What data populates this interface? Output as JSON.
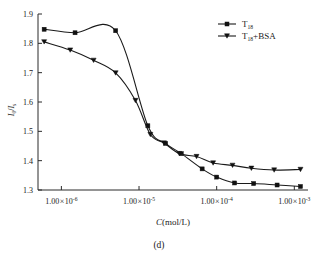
{
  "figure": {
    "caption": "(d)"
  },
  "chart_data": {
    "type": "line",
    "title": "",
    "subtitle": "",
    "xlabel": "C(mol/L)",
    "ylabel": "I0/Is",
    "ylabel_parts": {
      "numerator": "I",
      "numerator_sub": "0",
      "denominator": "I",
      "denominator_sub": "s"
    },
    "xscale": "log",
    "yscale": "linear",
    "xlim": [
      5e-07,
      0.0015
    ],
    "ylim": [
      1.3,
      1.9
    ],
    "grid": false,
    "legend_position": "top-right",
    "yticks": [
      1.3,
      1.4,
      1.5,
      1.6,
      1.7,
      1.8,
      1.9
    ],
    "ytick_labels": [
      "1.3",
      "1.4",
      "1.5",
      "1.6",
      "1.7",
      "1.8",
      "1.9"
    ],
    "xticks": [
      1e-06,
      1e-05,
      0.0001,
      0.001
    ],
    "xtick_labels": [
      {
        "mantissa": "1.00",
        "times": "×",
        "base": "10",
        "exponent": "-6"
      },
      {
        "mantissa": "1.00",
        "times": "×",
        "base": "10",
        "exponent": "-5"
      },
      {
        "mantissa": "1.00",
        "times": "×",
        "base": "10",
        "exponent": "-4"
      },
      {
        "mantissa": "1.00",
        "times": "×",
        "base": "10",
        "exponent": "-3"
      }
    ],
    "series": [
      {
        "name": "T18",
        "label_main": "T",
        "label_sub": "18",
        "label_suffix": "",
        "marker": "square",
        "color": "#111111",
        "x": [
          6e-07,
          1.5e-06,
          5e-06,
          1.3e-05,
          2.2e-05,
          3.5e-05,
          6.5e-05,
          0.0001,
          0.00017,
          0.0003,
          0.0006,
          0.0012
        ],
        "y": [
          1.848,
          1.836,
          1.843,
          1.519,
          1.459,
          1.424,
          1.372,
          1.344,
          1.324,
          1.322,
          1.317,
          1.312
        ]
      },
      {
        "name": "T18+BSA",
        "label_main": "T",
        "label_sub": "18",
        "label_suffix": "+BSA",
        "marker": "triangle-down",
        "color": "#111111",
        "x": [
          6e-07,
          1.3e-06,
          2.6e-06,
          5e-06,
          9e-06,
          1.4e-05,
          2.1e-05,
          3.3e-05,
          5.5e-05,
          9e-05,
          0.00016,
          0.00028,
          0.00055,
          0.0012
        ],
        "y": [
          1.805,
          1.777,
          1.742,
          1.699,
          1.605,
          1.489,
          1.46,
          1.424,
          1.414,
          1.392,
          1.384,
          1.374,
          1.368,
          1.37
        ]
      }
    ]
  }
}
